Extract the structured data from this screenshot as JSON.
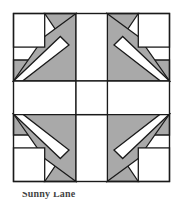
{
  "figure": {
    "name": "quilt-block-diagram",
    "kind": "quilt-block",
    "title_partial": "Sunny Lane",
    "grid": {
      "rows": 5,
      "cols": 5
    },
    "symmetry": "4-fold mirror (horizontal and vertical)",
    "colors": {
      "background": "#ffffff",
      "patch_light": "#ffffff",
      "patch_shade": "#a9a9a9",
      "outline": "#1a1a1a",
      "frame": "#1a1a1a",
      "caption_ink": "#2a2a2a"
    },
    "frame": {
      "x": 13.5,
      "y": 13.5,
      "width": 156,
      "height": 168,
      "stroke_width": 1.4
    },
    "cell": {
      "width": 31.2,
      "height": 33.6
    },
    "stroke_width": 1.3,
    "patch_counts": {
      "light_squares": 4,
      "shaded_bands": 4,
      "shaded_triangles": 16
    },
    "caption": {
      "visible": "clipped",
      "text": "Sunny Lane"
    }
  }
}
